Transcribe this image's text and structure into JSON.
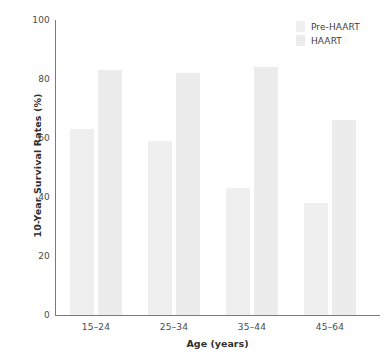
{
  "chart_data": {
    "type": "bar",
    "title": "",
    "subtitle": "",
    "xlabel": "Age (years)",
    "ylabel": "10-Year Survival Rates (%)",
    "categories": [
      "15–24",
      "25–34",
      "35–44",
      "45–64"
    ],
    "series": [
      {
        "name": "Pre-HAART",
        "values": [
          63,
          59,
          43,
          38
        ],
        "color": "#efefef"
      },
      {
        "name": "HAART",
        "values": [
          83,
          82,
          84,
          66
        ],
        "color": "#ececec"
      }
    ],
    "ylim": [
      0,
      100
    ],
    "yticks": [
      0,
      20,
      40,
      60,
      80,
      100
    ],
    "ytick_labels": [
      "0",
      "20",
      "40",
      "60",
      "80",
      "100"
    ],
    "grid": false,
    "legend_position": "top-right",
    "axis_color": "#777b7d",
    "text_color": "#3a3a3a"
  },
  "legend": {
    "entries": [
      {
        "label": "Pre-HAART"
      },
      {
        "label": "HAART"
      }
    ]
  }
}
